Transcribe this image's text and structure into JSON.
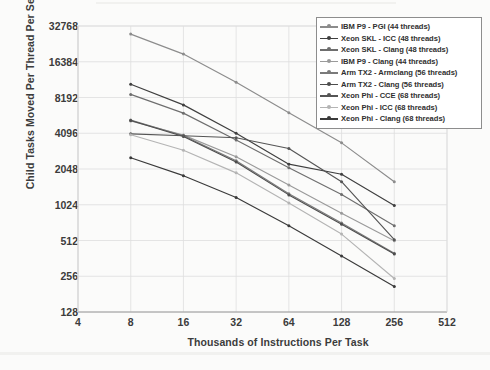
{
  "chart_data": {
    "type": "line",
    "title": "",
    "xlabel": "Thousands of Instructions Per Task",
    "ylabel": "Child Tasks Moved Per Thread Per Second",
    "xscale": "log2",
    "yscale": "log2",
    "xlim": [
      4,
      512
    ],
    "ylim": [
      128,
      32768
    ],
    "xticks": [
      4,
      8,
      16,
      32,
      64,
      128,
      256,
      512
    ],
    "yticks": [
      128,
      256,
      512,
      1024,
      2048,
      4096,
      8192,
      16384,
      32768
    ],
    "xtick_labels": [
      "4",
      "8",
      "16",
      "32",
      "64",
      "128",
      "256",
      "512"
    ],
    "ytick_labels": [
      "128",
      "256",
      "512",
      "1024",
      "2048",
      "4096",
      "8192",
      "16384",
      "32768"
    ],
    "grid": true,
    "legend_position": "top-right",
    "x": [
      8,
      16,
      32,
      64,
      128,
      256
    ],
    "series": [
      {
        "name": "IBM P9 - PGI (44 threads)",
        "color": "#8c8c8c",
        "marker": "dot",
        "values": [
          28000,
          19000,
          11000,
          6100,
          3400,
          1600
        ]
      },
      {
        "name": "Xeon SKL - ICC (48 threads)",
        "color": "#3f3f3f",
        "marker": "dot",
        "values": [
          10600,
          7100,
          4100,
          2250,
          1850,
          1010
        ]
      },
      {
        "name": "Xeon SKL - Clang (48 threads)",
        "color": "#6e6e6e",
        "marker": "dot",
        "values": [
          8700,
          6050,
          3600,
          2100,
          1250,
          680
        ]
      },
      {
        "name": "IBM P9 - Clang (44 threads)",
        "color": "#9a9a9a",
        "marker": "dot",
        "values": [
          5200,
          3950,
          2600,
          1500,
          870,
          510
        ]
      },
      {
        "name": "Arm TX2 - Armclang (56 threads)",
        "color": "#7a7a7a",
        "marker": "dot",
        "values": [
          5300,
          3900,
          2400,
          1270,
          720,
          400
        ]
      },
      {
        "name": "Arm TX2 - Clang (56 threads)",
        "color": "#4d4d4d",
        "marker": "dot",
        "values": [
          5250,
          3850,
          2350,
          1240,
          700,
          395
        ]
      },
      {
        "name": "Xeon Phi - CCE (68 threads)",
        "color": "#555555",
        "marker": "dot",
        "values": [
          4050,
          3900,
          3750,
          3050,
          1600,
          520
        ]
      },
      {
        "name": "Xeon Phi - ICC (68 threads)",
        "color": "#b4b4b4",
        "marker": "dot",
        "values": [
          3980,
          2950,
          1900,
          1060,
          580,
          245
        ]
      },
      {
        "name": "Xeon Phi - Clang (68 threads)",
        "color": "#3a3a3a",
        "marker": "dot",
        "values": [
          2550,
          1800,
          1180,
          680,
          380,
          210
        ]
      }
    ]
  },
  "axis": {
    "x_title": "Thousands of Instructions Per Task",
    "y_title": "Child Tasks Moved Per Thread Per Second"
  }
}
